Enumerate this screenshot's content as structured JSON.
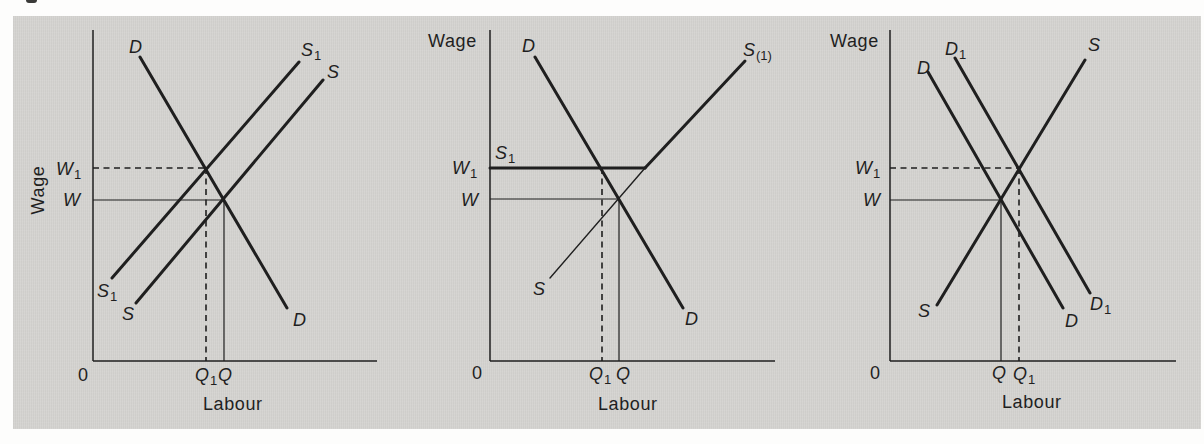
{
  "figure": {
    "colors": {
      "panel_bg": "#d5d4d1",
      "ink": "#1f1f1f",
      "page_bg": "#fdfdfc"
    },
    "panels": [
      {
        "name": "left-panel-supply-shift",
        "axes": {
          "x_axis": [
            [
              93,
              361
            ],
            [
              377,
              361
            ]
          ],
          "y_axis": [
            [
              93,
              30
            ],
            [
              93,
              361
            ]
          ]
        },
        "curves": [
          {
            "name": "demand-curve-D",
            "pts": [
              [
                140,
                57
              ],
              [
                287,
                308
              ]
            ],
            "w": 3
          },
          {
            "name": "supply-curve-S1-shifted",
            "pts": [
              [
                112,
                278
              ],
              [
                299,
                62
              ]
            ],
            "w": 3
          },
          {
            "name": "supply-curve-S",
            "pts": [
              [
                136,
                303
              ],
              [
                323,
                80
              ]
            ],
            "w": 3
          }
        ],
        "guides": [
          {
            "name": "w1-guide-horizontal-dashed",
            "pts": [
              [
                93,
                168
              ],
              [
                206,
                168
              ]
            ],
            "dash": true
          },
          {
            "name": "q1-guide-vertical-dashed",
            "pts": [
              [
                206,
                168
              ],
              [
                206,
                361
              ]
            ],
            "dash": true
          },
          {
            "name": "w-guide-horizontal",
            "pts": [
              [
                93,
                200
              ],
              [
                224,
                200
              ]
            ]
          },
          {
            "name": "q-guide-vertical",
            "pts": [
              [
                224,
                200
              ],
              [
                224,
                361
              ]
            ]
          }
        ],
        "labels": [
          {
            "name": "ylabel-wage",
            "text": "Wage",
            "x": 44,
            "y": 190,
            "rotate": -90,
            "anchor": "middle"
          },
          {
            "name": "xlabel-labour",
            "text": "Labour",
            "x": 203,
            "y": 410
          },
          {
            "name": "origin-label",
            "text": "0",
            "x": 78,
            "y": 381
          },
          {
            "name": "label-D-top",
            "text": "D",
            "italic": true,
            "x": 129,
            "y": 53
          },
          {
            "name": "label-S1-top",
            "text": "S",
            "sub": "1",
            "italic": true,
            "x": 301,
            "y": 56
          },
          {
            "name": "label-S-top",
            "text": "S",
            "italic": true,
            "x": 327,
            "y": 78
          },
          {
            "name": "label-W1",
            "text": "W",
            "sub": "1",
            "italic": true,
            "x": 56,
            "y": 175
          },
          {
            "name": "label-W",
            "text": "W",
            "italic": true,
            "x": 63,
            "y": 206
          },
          {
            "name": "label-S1-bottom",
            "text": "S",
            "sub": "1",
            "italic": true,
            "x": 97,
            "y": 297
          },
          {
            "name": "label-S-bottom",
            "text": "S",
            "italic": true,
            "x": 122,
            "y": 320
          },
          {
            "name": "label-D-bottom",
            "text": "D",
            "italic": true,
            "x": 293,
            "y": 326
          },
          {
            "name": "label-Q1",
            "text": "Q",
            "sub": "1",
            "italic": true,
            "x": 195,
            "y": 381
          },
          {
            "name": "label-Q",
            "text": "Q",
            "italic": true,
            "x": 218,
            "y": 381
          },
          {
            "name": "wage-axis-title-note",
            "text": "",
            "x": 0,
            "y": 0
          }
        ]
      },
      {
        "name": "middle-panel-minimum-wage",
        "axes": {
          "x_axis": [
            [
              490,
              361
            ],
            [
              775,
              361
            ]
          ],
          "y_axis": [
            [
              490,
              30
            ],
            [
              490,
              361
            ]
          ]
        },
        "curves": [
          {
            "name": "demand-curve-D",
            "pts": [
              [
                535,
                57
              ],
              [
                683,
                308
              ]
            ],
            "w": 3
          },
          {
            "name": "supply-curve-S-thin",
            "pts": [
              [
                550,
                278
              ],
              [
                645,
                168
              ]
            ],
            "w": 1.4
          },
          {
            "name": "wage-floor-S1-horizontal",
            "pts": [
              [
                490,
                168
              ],
              [
                645,
                168
              ]
            ],
            "w": 3
          },
          {
            "name": "supply-curve-S1-upper",
            "pts": [
              [
                645,
                168
              ],
              [
                745,
                61
              ]
            ],
            "w": 3
          }
        ],
        "guides": [
          {
            "name": "q1-guide-vertical-dashed",
            "pts": [
              [
                602,
                168
              ],
              [
                602,
                361
              ]
            ],
            "dash": true
          },
          {
            "name": "w-guide-horizontal",
            "pts": [
              [
                490,
                199
              ],
              [
                619,
                199
              ]
            ]
          },
          {
            "name": "q-guide-vertical",
            "pts": [
              [
                619,
                199
              ],
              [
                619,
                361
              ]
            ]
          }
        ],
        "labels": [
          {
            "name": "ylabel-wage",
            "text": "Wage",
            "x": 428,
            "y": 47
          },
          {
            "name": "xlabel-labour",
            "text": "Labour",
            "x": 598,
            "y": 410
          },
          {
            "name": "origin-label",
            "text": "0",
            "x": 472,
            "y": 379
          },
          {
            "name": "label-D-top",
            "text": "D",
            "italic": true,
            "x": 522,
            "y": 52
          },
          {
            "name": "label-S(1)-top",
            "text": "S",
            "sub": "(1)",
            "italic": true,
            "x": 743,
            "y": 56
          },
          {
            "name": "label-S1-floor",
            "text": "S",
            "sub": "1",
            "italic": true,
            "x": 495,
            "y": 159
          },
          {
            "name": "label-W1",
            "text": "W",
            "sub": "1",
            "italic": true,
            "x": 452,
            "y": 174
          },
          {
            "name": "label-W",
            "text": "W",
            "italic": true,
            "x": 461,
            "y": 206
          },
          {
            "name": "label-S-bottom",
            "text": "S",
            "italic": true,
            "x": 533,
            "y": 295
          },
          {
            "name": "label-D-bottom",
            "text": "D",
            "italic": true,
            "x": 685,
            "y": 325
          },
          {
            "name": "label-Q1",
            "text": "Q",
            "sub": "1",
            "italic": true,
            "x": 589,
            "y": 380
          },
          {
            "name": "label-Q",
            "text": "Q",
            "italic": true,
            "x": 616,
            "y": 380
          }
        ]
      },
      {
        "name": "right-panel-demand-shift",
        "axes": {
          "x_axis": [
            [
              890,
              361
            ],
            [
              1176,
              361
            ]
          ],
          "y_axis": [
            [
              890,
              30
            ],
            [
              890,
              361
            ]
          ]
        },
        "curves": [
          {
            "name": "demand-curve-D",
            "pts": [
              [
                928,
                72
              ],
              [
                1063,
                308
              ]
            ],
            "w": 3
          },
          {
            "name": "demand-curve-D1-shifted",
            "pts": [
              [
                955,
                58
              ],
              [
                1090,
                293
              ]
            ],
            "w": 3
          },
          {
            "name": "supply-curve-S",
            "pts": [
              [
                937,
                305
              ],
              [
                1085,
                60
              ]
            ],
            "w": 3
          }
        ],
        "guides": [
          {
            "name": "w1-guide-horizontal-dashed",
            "pts": [
              [
                890,
                168
              ],
              [
                1019,
                168
              ]
            ],
            "dash": true
          },
          {
            "name": "q1-guide-vertical-dashed",
            "pts": [
              [
                1019,
                168
              ],
              [
                1019,
                361
              ]
            ],
            "dash": true
          },
          {
            "name": "w-guide-horizontal",
            "pts": [
              [
                890,
                200
              ],
              [
                1001,
                200
              ]
            ]
          },
          {
            "name": "q-guide-vertical",
            "pts": [
              [
                1001,
                200
              ],
              [
                1001,
                361
              ]
            ]
          }
        ],
        "labels": [
          {
            "name": "ylabel-wage",
            "text": "Wage",
            "x": 830,
            "y": 47
          },
          {
            "name": "xlabel-labour",
            "text": "Labour",
            "x": 1002,
            "y": 408
          },
          {
            "name": "origin-label",
            "text": "0",
            "x": 870,
            "y": 379
          },
          {
            "name": "label-D-top",
            "text": "D",
            "italic": true,
            "x": 917,
            "y": 74
          },
          {
            "name": "label-D1-top",
            "text": "D",
            "sub": "1",
            "italic": true,
            "x": 945,
            "y": 55
          },
          {
            "name": "label-S-top",
            "text": "S",
            "italic": true,
            "x": 1088,
            "y": 51
          },
          {
            "name": "label-W1",
            "text": "W",
            "sub": "1",
            "italic": true,
            "x": 855,
            "y": 174
          },
          {
            "name": "label-W",
            "text": "W",
            "italic": true,
            "x": 863,
            "y": 206
          },
          {
            "name": "label-S-bottom",
            "text": "S",
            "italic": true,
            "x": 918,
            "y": 317
          },
          {
            "name": "label-D-bottom",
            "text": "D",
            "italic": true,
            "x": 1065,
            "y": 327
          },
          {
            "name": "label-D1-bottom",
            "text": "D",
            "sub": "1",
            "italic": true,
            "x": 1090,
            "y": 310
          },
          {
            "name": "label-Q",
            "text": "Q",
            "italic": true,
            "x": 992,
            "y": 379
          },
          {
            "name": "label-Q1",
            "text": "Q",
            "sub": "1",
            "italic": true,
            "x": 1013,
            "y": 380
          }
        ]
      }
    ]
  }
}
